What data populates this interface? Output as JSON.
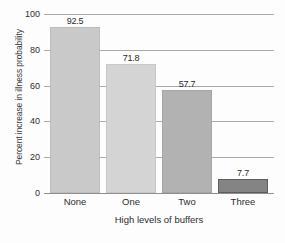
{
  "chart_data": {
    "type": "bar",
    "title": "",
    "xlabel": "High levels of buffers",
    "ylabel": "Percent increase in illness probability",
    "categories": [
      "None",
      "One",
      "Two",
      "Three"
    ],
    "values": [
      92.5,
      71.8,
      57.7,
      7.7
    ],
    "value_labels": [
      "92.5",
      "71.8",
      "57.7",
      "7.7"
    ],
    "bar_colors": [
      "#c9c9c9",
      "#d4d4d4",
      "#b2b2b2",
      "#848484"
    ],
    "bar_border_colors": [
      "#bdbdbd",
      "#c8c8c8",
      "#a6a6a6",
      "#5d5d5d"
    ],
    "ylim": [
      0,
      100
    ],
    "ytick_values": [
      100,
      80,
      60,
      40,
      20,
      0
    ],
    "ytick_labels": [
      "100",
      "80",
      "60",
      "40",
      "20",
      "0"
    ],
    "grid": true,
    "legend": false,
    "legend_position": "none"
  },
  "axes": {
    "y_title": "Percent increase in illness probability",
    "x_title": "High levels of buffers"
  },
  "colors": {
    "background": "#fdfdfd",
    "gridline": "#a9a9a9",
    "baseline": "#8f8f8f",
    "text": "#2d2d2d"
  }
}
